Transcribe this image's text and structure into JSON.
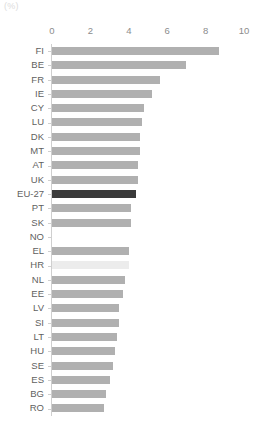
{
  "unit_label": "(%)",
  "axis": {
    "ticks": [
      0,
      2,
      4,
      6,
      8,
      10
    ],
    "tick_labels": [
      "0",
      "2",
      "4",
      "6",
      "8",
      "10"
    ],
    "min": 0,
    "max": 10
  },
  "colors": {
    "bar": "#b0b0b0",
    "highlight": "#3a3a3a",
    "faint": "#ececec",
    "axis": "#cfcfcf",
    "label": "#5f5f5f",
    "tick_label": "#8c8c8c",
    "unit_label": "#dcdcdc",
    "background": "#ffffff"
  },
  "chart_data": {
    "type": "bar",
    "orientation": "horizontal",
    "title": "",
    "subtitle": "",
    "xlabel": "(%)",
    "ylabel": "",
    "xlim": [
      0,
      10
    ],
    "grid": false,
    "legend": null,
    "highlight_category": "EU-27",
    "categories": [
      "FI",
      "BE",
      "FR",
      "IE",
      "CY",
      "LU",
      "DK",
      "MT",
      "AT",
      "UK",
      "EU-27",
      "PT",
      "SK",
      "NO",
      "EL",
      "HR",
      "NL",
      "EE",
      "LV",
      "SI",
      "LT",
      "HU",
      "SE",
      "ES",
      "BG",
      "RO"
    ],
    "values": [
      8.7,
      7.0,
      5.6,
      5.2,
      4.8,
      4.7,
      4.6,
      4.6,
      4.5,
      4.5,
      4.4,
      4.1,
      4.1,
      null,
      4.0,
      4.0,
      3.8,
      3.7,
      3.5,
      3.5,
      3.4,
      3.3,
      3.2,
      3.0,
      2.8,
      2.7
    ],
    "bars": [
      {
        "label": "FI",
        "value": 8.7,
        "style": "normal"
      },
      {
        "label": "BE",
        "value": 7.0,
        "style": "normal"
      },
      {
        "label": "FR",
        "value": 5.6,
        "style": "normal"
      },
      {
        "label": "IE",
        "value": 5.2,
        "style": "normal"
      },
      {
        "label": "CY",
        "value": 4.8,
        "style": "normal"
      },
      {
        "label": "LU",
        "value": 4.7,
        "style": "normal"
      },
      {
        "label": "DK",
        "value": 4.6,
        "style": "normal"
      },
      {
        "label": "MT",
        "value": 4.6,
        "style": "normal"
      },
      {
        "label": "AT",
        "value": 4.5,
        "style": "normal"
      },
      {
        "label": "UK",
        "value": 4.5,
        "style": "normal"
      },
      {
        "label": "EU-27",
        "value": 4.4,
        "style": "highlight"
      },
      {
        "label": "PT",
        "value": 4.1,
        "style": "normal"
      },
      {
        "label": "SK",
        "value": 4.1,
        "style": "normal"
      },
      {
        "label": "NO",
        "value": null,
        "style": "empty"
      },
      {
        "label": "EL",
        "value": 4.0,
        "style": "normal"
      },
      {
        "label": "HR",
        "value": 4.0,
        "style": "faint"
      },
      {
        "label": "NL",
        "value": 3.8,
        "style": "normal"
      },
      {
        "label": "EE",
        "value": 3.7,
        "style": "normal"
      },
      {
        "label": "LV",
        "value": 3.5,
        "style": "normal"
      },
      {
        "label": "SI",
        "value": 3.5,
        "style": "normal"
      },
      {
        "label": "LT",
        "value": 3.4,
        "style": "normal"
      },
      {
        "label": "HU",
        "value": 3.3,
        "style": "normal"
      },
      {
        "label": "SE",
        "value": 3.2,
        "style": "normal"
      },
      {
        "label": "ES",
        "value": 3.0,
        "style": "normal"
      },
      {
        "label": "BG",
        "value": 2.8,
        "style": "normal"
      },
      {
        "label": "RO",
        "value": 2.7,
        "style": "normal"
      }
    ]
  }
}
